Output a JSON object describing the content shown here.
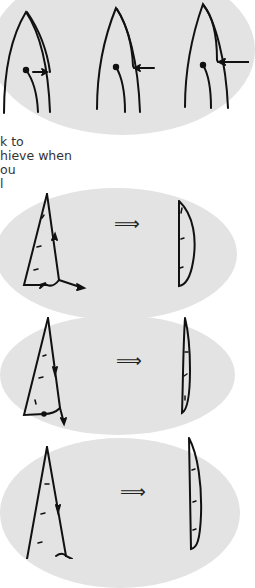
{
  "page": {
    "background": "#ffffff",
    "ellipse_color": "#e3e3e3",
    "ink_color": "#111111"
  },
  "text_fragment": {
    "lines": [
      "k to",
      "hieve when",
      "ou",
      "l"
    ]
  },
  "figure_top": {
    "description": "Three sail outlines showing increasing leech curvature, with dot and arrow indicators",
    "panels": [
      "sail-shape-1",
      "sail-shape-2",
      "sail-shape-3"
    ]
  },
  "figure_rows": [
    {
      "symbol": "⟹",
      "left": "triangular sail with upward arrows on leech and foot",
      "right": "curved sail profile"
    },
    {
      "symbol": "⟹",
      "left": "triangular sail with downward arrow on leech",
      "right": "flat thin sail profile"
    },
    {
      "symbol": "⟹",
      "left": "triangular sail with downward arrow on leech",
      "right": "curved sail profile"
    }
  ]
}
